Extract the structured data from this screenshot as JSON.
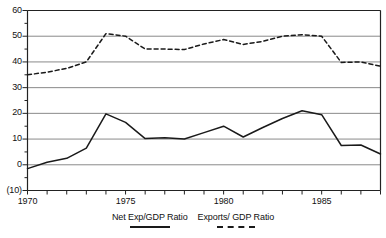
{
  "chart_data": {
    "type": "line",
    "title": "",
    "xlabel": "",
    "ylabel": "",
    "xlim": [
      1970,
      1988
    ],
    "ylim": [
      -10,
      60
    ],
    "grid": true,
    "grid_axis": "y",
    "legend_position": "bottom",
    "x": [
      1970,
      1971,
      1972,
      1973,
      1974,
      1975,
      1976,
      1977,
      1978,
      1979,
      1980,
      1981,
      1982,
      1983,
      1984,
      1985,
      1986,
      1987,
      1988
    ],
    "y_ticks": [
      0,
      10,
      20,
      30,
      40,
      50,
      60
    ],
    "y_tick_labels": [
      "(10)",
      "0",
      "10",
      "20",
      "30",
      "40",
      "50",
      "60"
    ],
    "y_tick_values": [
      -10,
      0,
      10,
      20,
      30,
      40,
      50,
      60
    ],
    "x_ticks": [
      1970,
      1975,
      1980,
      1985
    ],
    "x_tick_labels": [
      "1970",
      "1975",
      "1980",
      "1985"
    ],
    "series": [
      {
        "name": "Net Exp/GDP Ratio",
        "style": "solid",
        "color": "#1a1a1a",
        "values": [
          -1.5,
          1.0,
          2.5,
          6.5,
          19.8,
          16.5,
          10.2,
          10.5,
          10.0,
          12.5,
          15.0,
          10.8,
          14.5,
          18.0,
          21.0,
          19.5,
          7.5,
          7.7,
          4.2
        ]
      },
      {
        "name": "Exports/ GDP Ratio",
        "style": "dashed",
        "color": "#1a1a1a",
        "values": [
          35.0,
          36.0,
          37.5,
          40.0,
          51.0,
          50.0,
          45.0,
          45.0,
          44.8,
          47.0,
          48.7,
          46.8,
          48.0,
          50.0,
          50.6,
          50.0,
          39.8,
          40.0,
          38.3
        ]
      }
    ]
  },
  "legend": {
    "items": [
      {
        "label": "Net Exp/GDP Ratio",
        "style": "solid"
      },
      {
        "label": "Exports/ GDP Ratio",
        "style": "dashed"
      }
    ]
  },
  "colors": {
    "axis": "#222222",
    "grid": "#8a8a8a",
    "series": "#1a1a1a",
    "background": "#ffffff"
  }
}
